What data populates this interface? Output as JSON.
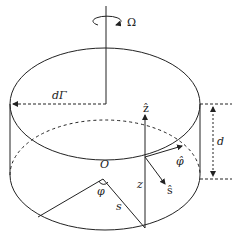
{
  "diagram": {
    "labels": {
      "omega": "Ω",
      "gamma": "dΓ",
      "z_hat": "ẑ",
      "phi_hat": "φ̂",
      "s_hat": "ŝ",
      "origin": "O",
      "phi": "φ",
      "s": "s",
      "z": "z",
      "d": "d"
    },
    "colors": {
      "stroke": "#222222",
      "background": "#ffffff"
    }
  }
}
